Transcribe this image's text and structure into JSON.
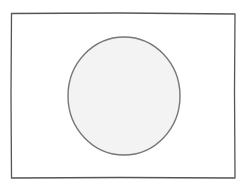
{
  "drawing": {
    "subject": "flag sketch",
    "rectangle": {
      "x": 11,
      "y": 13,
      "width": 224,
      "height": 165,
      "stroke": "#555555",
      "fill": "#ffffff"
    },
    "circle": {
      "cx": 124,
      "cy": 96,
      "rx": 56,
      "ry": 59,
      "stroke": "#777777",
      "fill": "#f3f3f3"
    }
  }
}
